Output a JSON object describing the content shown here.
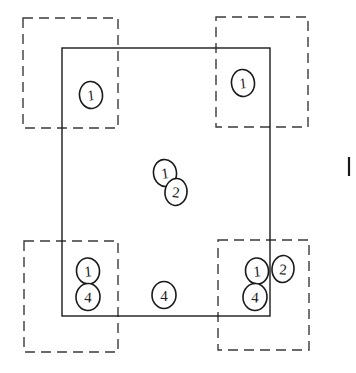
{
  "diagram": {
    "canvas": {
      "width": 356,
      "height": 373,
      "background": "#ffffff"
    },
    "colors": {
      "solid_stroke": "#1a1a1a",
      "dashed_stroke": "#3a3a3a",
      "marker_stroke": "#1a1a1a",
      "marker_fill": "#ffffff",
      "text": "#1a1a1a"
    },
    "solid_region": {
      "label": "main-solid-rectangle",
      "x": 62,
      "y": 48,
      "width": 208,
      "height": 268,
      "stroke_width": 1.4,
      "style": "solid"
    },
    "dashed_regions": [
      {
        "label": "top-left-dashed-box",
        "x": 23,
        "y": 18,
        "width": 95,
        "height": 110,
        "style": "dashed"
      },
      {
        "label": "top-right-dashed-box",
        "x": 216,
        "y": 17,
        "width": 92,
        "height": 110,
        "style": "dashed"
      },
      {
        "label": "bottom-left-dashed-box",
        "x": 24,
        "y": 241,
        "width": 94,
        "height": 111,
        "style": "dashed"
      },
      {
        "label": "bottom-right-dashed-box",
        "x": 218,
        "y": 240,
        "width": 91,
        "height": 110,
        "style": "dashed"
      }
    ],
    "dash_pattern": "10 6",
    "dashed_stroke_width": 1.4,
    "markers": [
      {
        "id": "marker-top-left-1",
        "value": "1",
        "cx": 91,
        "cy": 95,
        "rx": 11.5,
        "ry": 13.5,
        "rotate": -6,
        "font_size": 15
      },
      {
        "id": "marker-top-right-1",
        "value": "1",
        "cx": 243,
        "cy": 83,
        "rx": 11.5,
        "ry": 13.5,
        "rotate": -6,
        "font_size": 15
      },
      {
        "id": "marker-center-1",
        "value": "1",
        "cx": 165,
        "cy": 173,
        "rx": 11.5,
        "ry": 13.5,
        "rotate": -8,
        "font_size": 15
      },
      {
        "id": "marker-center-2",
        "value": "2",
        "cx": 176,
        "cy": 192,
        "rx": 11.0,
        "ry": 13.5,
        "rotate": 6,
        "font_size": 15
      },
      {
        "id": "marker-bottom-left-1",
        "value": "1",
        "cx": 88,
        "cy": 271,
        "rx": 11.5,
        "ry": 13.0,
        "rotate": -5,
        "font_size": 15
      },
      {
        "id": "marker-bottom-left-4",
        "value": "4",
        "cx": 88,
        "cy": 297,
        "rx": 12.0,
        "ry": 13.5,
        "rotate": 3,
        "font_size": 15
      },
      {
        "id": "marker-bottom-center-4",
        "value": "4",
        "cx": 164,
        "cy": 295,
        "rx": 12.0,
        "ry": 13.5,
        "rotate": 0,
        "font_size": 15
      },
      {
        "id": "marker-bottom-right-1",
        "value": "1",
        "cx": 257,
        "cy": 271,
        "rx": 11.5,
        "ry": 13.0,
        "rotate": -5,
        "font_size": 15
      },
      {
        "id": "marker-bottom-right-2",
        "value": "2",
        "cx": 283,
        "cy": 269,
        "rx": 11.0,
        "ry": 13.5,
        "rotate": 4,
        "font_size": 15
      },
      {
        "id": "marker-bottom-right-4",
        "value": "4",
        "cx": 255,
        "cy": 297,
        "rx": 12.0,
        "ry": 13.5,
        "rotate": 3,
        "font_size": 15
      }
    ],
    "tick_mark": {
      "label": "right-edge-tick-mark",
      "x1": 349,
      "y1": 157,
      "x2": 349,
      "y2": 176,
      "stroke_width": 2.2
    }
  }
}
